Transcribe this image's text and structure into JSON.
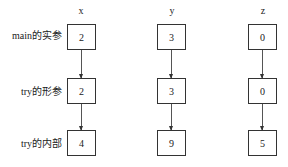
{
  "diagram": {
    "columns": [
      {
        "name": "x",
        "values": [
          "2",
          "2",
          "4"
        ]
      },
      {
        "name": "y",
        "values": [
          "3",
          "3",
          "9"
        ]
      },
      {
        "name": "z",
        "values": [
          "0",
          "0",
          "5"
        ]
      }
    ],
    "rows": [
      {
        "label": "main的实参"
      },
      {
        "label": "try的形参"
      },
      {
        "label": "try的内部"
      }
    ],
    "colors": {
      "border": "#333333",
      "arrow": "#555555",
      "text": "#222222",
      "background": "#ffffff"
    }
  }
}
